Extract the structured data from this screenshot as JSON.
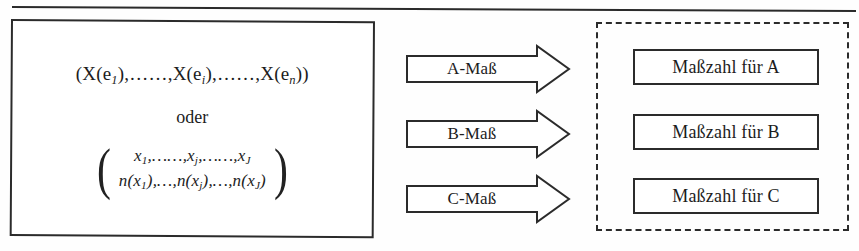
{
  "diagram": {
    "top_rule": "horizontal-rule",
    "source": {
      "vector_line": "(X(e₁),…,X(eᵢ),…,X(eₙ))",
      "vector_parts": {
        "open": "(X(e",
        "sub_1": "1",
        "mid_1": "),……,X(e",
        "sub_i": "i",
        "mid_2": "),……,X(e",
        "sub_n": "n",
        "close": "))"
      },
      "connector": "oder",
      "matrix": {
        "left_paren": "(",
        "right_paren": ")",
        "row_top": "x₁,……,xⱼ,……,xⱼ",
        "row_bottom": "n(x₁),…,n(xⱼ),…,n(xⱼ)",
        "row_top_parts": {
          "a": "x",
          "a_sub": "1",
          "b": ",……,x",
          "b_sub": "j",
          "c": ",……,x",
          "c_sub": "J"
        },
        "row_bottom_parts": {
          "a": "n(x",
          "a_sub": "1",
          "b": "),…,n(x",
          "b_sub": "j",
          "c": "),…,n(x",
          "c_sub": "J",
          "end": ")"
        }
      }
    },
    "arrows": [
      {
        "label": "A-Maß",
        "name": "arrow-a-mass"
      },
      {
        "label": "B-Maß",
        "name": "arrow-b-mass"
      },
      {
        "label": "C-Maß",
        "name": "arrow-c-mass"
      }
    ],
    "results": [
      {
        "label": "Maßzahl für A"
      },
      {
        "label": "Maßzahl für B"
      },
      {
        "label": "Maßzahl für C"
      }
    ],
    "colors": {
      "ink": "#2b2b2b",
      "paper": "#fefefe"
    }
  }
}
